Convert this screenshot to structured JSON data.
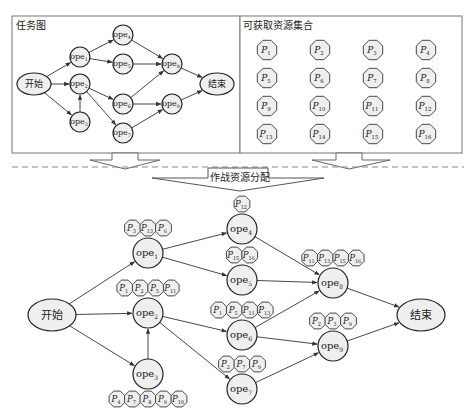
{
  "top_left_panel": {
    "title": "任务图",
    "nodes": [
      {
        "id": "start",
        "label": "开始",
        "shape": "ellipse",
        "x": 34,
        "y": 84
      },
      {
        "id": "ope1",
        "label": "ope",
        "sub": "1",
        "x": 80,
        "y": 57
      },
      {
        "id": "ope2",
        "label": "ope",
        "sub": "2",
        "x": 80,
        "y": 84
      },
      {
        "id": "ope3",
        "label": "ope",
        "sub": "3",
        "x": 80,
        "y": 122
      },
      {
        "id": "ope4",
        "label": "ope",
        "sub": "4",
        "x": 123,
        "y": 35
      },
      {
        "id": "ope5",
        "label": "ope",
        "sub": "5",
        "x": 123,
        "y": 64
      },
      {
        "id": "ope6",
        "label": "ope",
        "sub": "6",
        "x": 123,
        "y": 104
      },
      {
        "id": "ope7",
        "label": "ope",
        "sub": "7",
        "x": 123,
        "y": 133
      },
      {
        "id": "ope8",
        "label": "ope",
        "sub": "8",
        "x": 172,
        "y": 64
      },
      {
        "id": "ope9",
        "label": "ope",
        "sub": "9",
        "x": 172,
        "y": 104
      },
      {
        "id": "end",
        "label": "结束",
        "shape": "ellipse",
        "x": 217,
        "y": 84
      }
    ]
  },
  "top_right_panel": {
    "title": "可获取资源集合",
    "resources": [
      "1",
      "2",
      "3",
      "4",
      "5",
      "6",
      "7",
      "8",
      "9",
      "10",
      "11",
      "12",
      "13",
      "14",
      "15",
      "16"
    ],
    "resource_prefix": "P"
  },
  "center_arrow_label": "作战资源分配",
  "bottom_graph": {
    "nodes": [
      {
        "id": "start",
        "label": "开始",
        "shape": "ellipse",
        "x": 52,
        "y": 315
      },
      {
        "id": "ope1",
        "label": "ope",
        "sub": "1",
        "x": 148,
        "y": 253
      },
      {
        "id": "ope2",
        "label": "ope",
        "sub": "2",
        "x": 148,
        "y": 313
      },
      {
        "id": "ope3",
        "label": "ope",
        "sub": "3",
        "x": 148,
        "y": 374
      },
      {
        "id": "ope4",
        "label": "ope",
        "sub": "4",
        "x": 242,
        "y": 229
      },
      {
        "id": "ope5",
        "label": "ope",
        "sub": "5",
        "x": 242,
        "y": 280
      },
      {
        "id": "ope6",
        "label": "ope",
        "sub": "6",
        "x": 242,
        "y": 335
      },
      {
        "id": "ope7",
        "label": "ope",
        "sub": "7",
        "x": 242,
        "y": 389
      },
      {
        "id": "ope8",
        "label": "ope",
        "sub": "8",
        "x": 333,
        "y": 283
      },
      {
        "id": "ope9",
        "label": "ope",
        "sub": "9",
        "x": 333,
        "y": 346
      },
      {
        "id": "end",
        "label": "结束",
        "shape": "ellipse",
        "x": 421,
        "y": 315
      }
    ],
    "resource_assignments": [
      {
        "node": "ope1",
        "resources": [
          "3",
          "13",
          "6"
        ],
        "position": "above"
      },
      {
        "node": "ope2",
        "resources": [
          "1",
          "2",
          "5",
          "11"
        ],
        "position": "above"
      },
      {
        "node": "ope3",
        "resources": [
          "4",
          "7",
          "8",
          "9",
          "10"
        ],
        "position": "below"
      },
      {
        "node": "ope4",
        "resources": [
          "12"
        ],
        "position": "above"
      },
      {
        "node": "ope5",
        "resources": [
          "15",
          "16"
        ],
        "position": "above"
      },
      {
        "node": "ope6",
        "resources": [
          "1",
          "5",
          "11",
          "13"
        ],
        "position": "above"
      },
      {
        "node": "ope7",
        "resources": [
          "2",
          "7",
          "9"
        ],
        "position": "above"
      },
      {
        "node": "ope8",
        "resources": [
          "11",
          "13",
          "15",
          "16"
        ],
        "position": "above"
      },
      {
        "node": "ope9",
        "resources": [
          "2",
          "3",
          "9"
        ],
        "position": "above"
      }
    ]
  },
  "edges": [
    [
      "start",
      "ope1"
    ],
    [
      "start",
      "ope2"
    ],
    [
      "start",
      "ope3"
    ],
    [
      "ope3",
      "ope2"
    ],
    [
      "ope1",
      "ope4"
    ],
    [
      "ope1",
      "ope5"
    ],
    [
      "ope2",
      "ope6"
    ],
    [
      "ope2",
      "ope7"
    ],
    [
      "ope4",
      "ope8"
    ],
    [
      "ope5",
      "ope8"
    ],
    [
      "ope6",
      "ope8"
    ],
    [
      "ope6",
      "ope9"
    ],
    [
      "ope7",
      "ope9"
    ],
    [
      "ope8",
      "end"
    ],
    [
      "ope9",
      "end"
    ]
  ]
}
